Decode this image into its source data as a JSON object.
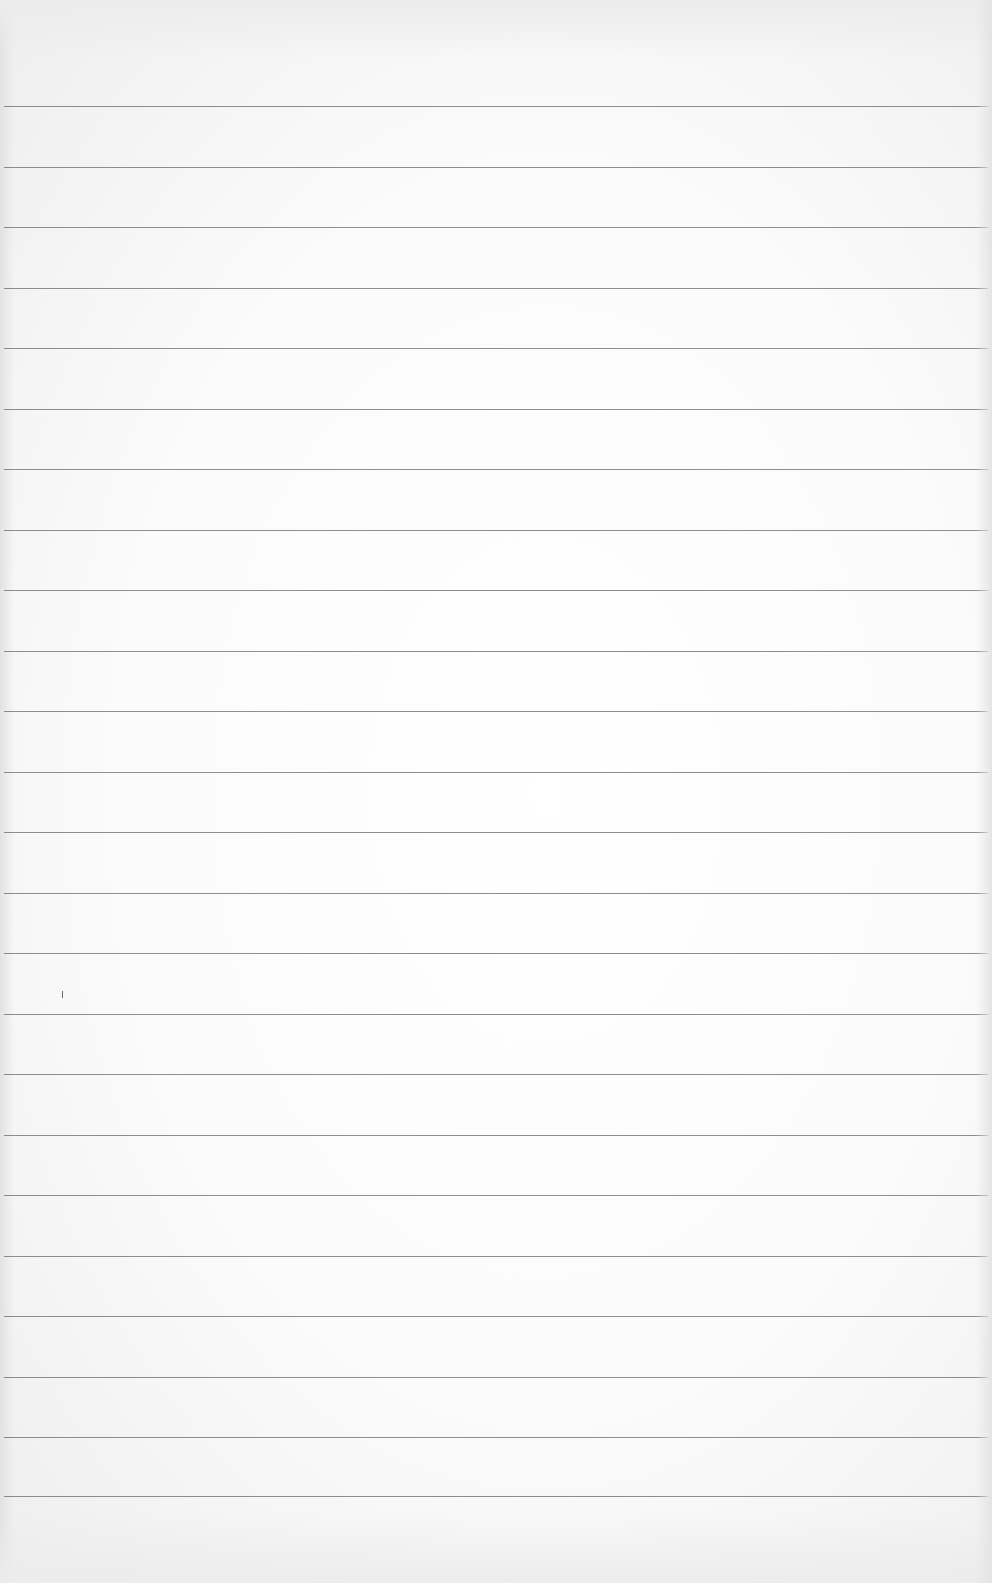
{
  "page": {
    "type": "lined-paper",
    "background_color": "#fafafa",
    "line_color": "#7a7a7a"
  },
  "ruled_lines": {
    "count": 24,
    "positions_y": [
      106,
      167,
      227,
      288,
      348,
      409,
      469,
      530,
      590,
      651,
      711,
      772,
      832,
      893,
      953,
      1014,
      1074,
      1135,
      1195,
      1256,
      1316,
      1377,
      1437,
      1496
    ]
  },
  "marks": [
    {
      "type": "pencil-tick",
      "x": 62,
      "y": 991
    }
  ]
}
